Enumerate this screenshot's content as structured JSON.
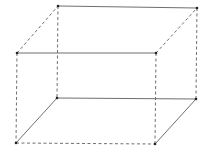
{
  "diagram": {
    "title": "",
    "shape": "rectangular-box",
    "stroke_color": "#6f6f6f",
    "vertex_color": "#222222",
    "vertices": {
      "top_back_left": {
        "x": 58,
        "y": 6
      },
      "top_back_right": {
        "x": 197,
        "y": 8
      },
      "top_front_left": {
        "x": 17,
        "y": 53
      },
      "top_front_right": {
        "x": 156,
        "y": 53
      },
      "bottom_back_left": {
        "x": 57,
        "y": 98
      },
      "bottom_back_right": {
        "x": 196,
        "y": 99
      },
      "bottom_front_left": {
        "x": 16,
        "y": 143
      },
      "bottom_front_right": {
        "x": 155,
        "y": 144
      }
    },
    "edges": [
      {
        "name": "top-back-edge",
        "from": "top_back_left",
        "to": "top_back_right",
        "style": "solid"
      },
      {
        "name": "top-front-edge",
        "from": "top_front_left",
        "to": "top_front_right",
        "style": "solid"
      },
      {
        "name": "top-left-edge",
        "from": "top_front_left",
        "to": "top_back_left",
        "style": "dashed"
      },
      {
        "name": "top-right-edge",
        "from": "top_front_right",
        "to": "top_back_right",
        "style": "dashed"
      },
      {
        "name": "bottom-back-edge",
        "from": "bottom_back_left",
        "to": "bottom_back_right",
        "style": "solid"
      },
      {
        "name": "bottom-front-edge",
        "from": "bottom_front_left",
        "to": "bottom_front_right",
        "style": "dashed"
      },
      {
        "name": "bottom-left-edge",
        "from": "bottom_front_left",
        "to": "bottom_back_left",
        "style": "solid"
      },
      {
        "name": "bottom-right-edge",
        "from": "bottom_front_right",
        "to": "bottom_back_right",
        "style": "solid"
      },
      {
        "name": "vertical-back-left",
        "from": "top_back_left",
        "to": "bottom_back_left",
        "style": "dashed"
      },
      {
        "name": "vertical-back-right",
        "from": "top_back_right",
        "to": "bottom_back_right",
        "style": "dashed"
      },
      {
        "name": "vertical-front-left",
        "from": "top_front_left",
        "to": "bottom_front_left",
        "style": "dashed"
      },
      {
        "name": "vertical-front-right",
        "from": "top_front_right",
        "to": "bottom_front_right",
        "style": "dashed"
      }
    ]
  }
}
